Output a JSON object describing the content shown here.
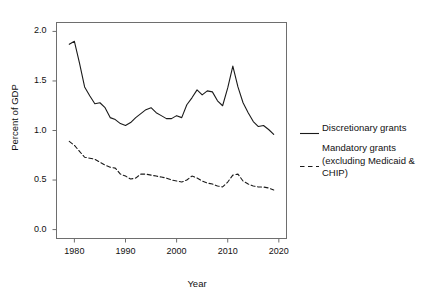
{
  "chart_data": {
    "type": "line",
    "title": "",
    "xlabel": "Year",
    "ylabel": "Percent of GDP",
    "xlim": [
      1976.5,
      2021.5
    ],
    "ylim": [
      -0.09,
      2.09
    ],
    "xticks": [
      1980,
      1990,
      2000,
      2010,
      2020
    ],
    "xtick_labels": [
      "1980",
      "1990",
      "2000",
      "2010",
      "2020"
    ],
    "yticks": [
      0.0,
      0.5,
      1.0,
      1.5,
      2.0
    ],
    "ytick_labels": [
      "0.0",
      "0.5",
      "1.0",
      "1.5",
      "2.0"
    ],
    "grid": false,
    "legend_position": "right",
    "x": [
      1979,
      1980,
      1981,
      1982,
      1983,
      1984,
      1985,
      1986,
      1987,
      1988,
      1989,
      1990,
      1991,
      1992,
      1993,
      1994,
      1995,
      1996,
      1997,
      1998,
      1999,
      2000,
      2001,
      2002,
      2003,
      2004,
      2005,
      2006,
      2007,
      2008,
      2009,
      2010,
      2011,
      2012,
      2013,
      2014,
      2015,
      2016,
      2017,
      2018,
      2019
    ],
    "series": [
      {
        "name": "Discretionary grants",
        "style": "solid",
        "color": "#1a1a1a",
        "values": [
          1.87,
          1.9,
          1.68,
          1.44,
          1.35,
          1.27,
          1.28,
          1.23,
          1.13,
          1.11,
          1.07,
          1.05,
          1.08,
          1.13,
          1.17,
          1.21,
          1.23,
          1.18,
          1.15,
          1.12,
          1.12,
          1.15,
          1.13,
          1.26,
          1.33,
          1.41,
          1.36,
          1.4,
          1.39,
          1.3,
          1.25,
          1.43,
          1.65,
          1.44,
          1.28,
          1.18,
          1.09,
          1.04,
          1.05,
          1.01,
          0.96
        ]
      },
      {
        "name": "Mandatory grants\n(excluding Medicaid &\nCHIP)",
        "style": "dashed",
        "color": "#1a1a1a",
        "values": [
          0.89,
          0.85,
          0.79,
          0.73,
          0.72,
          0.71,
          0.68,
          0.65,
          0.63,
          0.62,
          0.56,
          0.54,
          0.51,
          0.52,
          0.56,
          0.56,
          0.55,
          0.54,
          0.53,
          0.52,
          0.5,
          0.49,
          0.48,
          0.5,
          0.54,
          0.52,
          0.49,
          0.47,
          0.46,
          0.44,
          0.43,
          0.48,
          0.55,
          0.56,
          0.49,
          0.46,
          0.44,
          0.43,
          0.43,
          0.42,
          0.4
        ]
      }
    ]
  },
  "legend": {
    "entries": [
      {
        "label": "Discretionary grants",
        "style": "solid"
      },
      {
        "label": "Mandatory grants\n(excluding Medicaid &\nCHIP)",
        "style": "dashed"
      }
    ]
  },
  "axes": {
    "x_title": "Year",
    "y_title": "Percent of GDP"
  }
}
